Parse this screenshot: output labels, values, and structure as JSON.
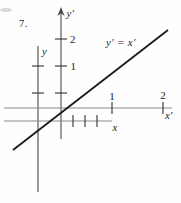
{
  "problem_number": "7.",
  "figure": {
    "background": "#fefefe",
    "colors": {
      "axis_light": "#8a8a8a",
      "axis_dark": "#4a4a4a",
      "tick": "#2f2f2f",
      "ink": "#1a1a1a",
      "smudge": "#d9d9d9"
    },
    "equation_label": "y′ = x′",
    "axis_labels": {
      "y_prime": "y′",
      "y": "y",
      "x_prime": "x′",
      "x": "x"
    },
    "tick_labels": {
      "y_prime_2": "2",
      "y_prime_1": "1",
      "x_prime_1": "1",
      "x_prime_2": "2"
    },
    "geometry": {
      "canvas": {
        "width": 181,
        "height": 203
      },
      "axes": [
        {
          "name": "y-prime-axis",
          "x1": 61,
          "y1": 12,
          "x2": 61,
          "y2": 139,
          "tone": "axis_dark"
        },
        {
          "name": "y-axis",
          "x1": 38,
          "y1": 46,
          "x2": 38,
          "y2": 192,
          "tone": "axis_dark"
        },
        {
          "name": "x-prime-axis",
          "x1": 4,
          "y1": 108,
          "x2": 172,
          "y2": 108,
          "tone": "axis_light"
        },
        {
          "name": "x-axis",
          "x1": 4,
          "y1": 121,
          "x2": 112,
          "y2": 121,
          "tone": "axis_light"
        }
      ],
      "ticks": [
        {
          "name": "y-prime-tick-2",
          "x1": 55,
          "y1": 39,
          "x2": 67,
          "y2": 39
        },
        {
          "name": "y-prime-tick-1",
          "x1": 55,
          "y1": 66,
          "x2": 67,
          "y2": 66
        },
        {
          "name": "y-prime-tick-unlabeled",
          "x1": 55,
          "y1": 93,
          "x2": 67,
          "y2": 93
        },
        {
          "name": "y-tick-upper",
          "x1": 32,
          "y1": 66,
          "x2": 44,
          "y2": 66
        },
        {
          "name": "y-tick-lower",
          "x1": 32,
          "y1": 93,
          "x2": 44,
          "y2": 93
        },
        {
          "name": "x-prime-tick-1",
          "x1": 112,
          "y1": 102,
          "x2": 112,
          "y2": 114
        },
        {
          "name": "x-prime-tick-2",
          "x1": 163,
          "y1": 102,
          "x2": 163,
          "y2": 114
        },
        {
          "name": "x-tick-1",
          "x1": 73,
          "y1": 115,
          "x2": 73,
          "y2": 127
        },
        {
          "name": "x-tick-2",
          "x1": 85,
          "y1": 115,
          "x2": 85,
          "y2": 127
        },
        {
          "name": "x-tick-3",
          "x1": 97,
          "y1": 115,
          "x2": 97,
          "y2": 127
        }
      ],
      "arrowhead": "61,7 57.4,16 61,13.2 64.6,16",
      "diagonal_line": {
        "name": "line-y-prime-equals-x-prime",
        "x1": 13,
        "y1": 150,
        "x2": 168,
        "y2": 30
      },
      "smudge": {
        "cx": 6,
        "cy": 10,
        "rx": 6,
        "ry": 2
      }
    }
  },
  "chart_data": {
    "type": "line",
    "title": "",
    "annotations": [
      "y′ = x′"
    ],
    "series": [
      {
        "name": "y′ = x′",
        "x": [
          -1.1,
          2.1
        ],
        "y": [
          -1.1,
          2.1
        ]
      }
    ],
    "axes": {
      "x_prime": {
        "label": "x′",
        "tick_labels": [
          "1",
          "2"
        ]
      },
      "y_prime": {
        "label": "y′",
        "tick_labels": [
          "1",
          "2"
        ]
      },
      "x": {
        "label": "x",
        "unlabeled_ticks": 3
      },
      "y": {
        "label": "y",
        "unlabeled_ticks": 2
      }
    },
    "grid": false,
    "legend": false
  }
}
